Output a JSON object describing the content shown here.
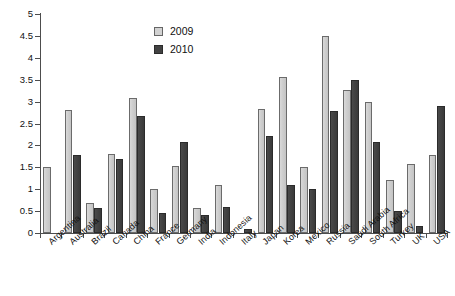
{
  "chart_data": {
    "type": "bar",
    "title": "",
    "subtitle": "",
    "xlabel": "",
    "ylabel": "",
    "ylim": [
      0,
      5
    ],
    "ytick_labels": [
      "0",
      "0.5",
      "1",
      "1.5",
      "2",
      "2.5",
      "3",
      "3.5",
      "4",
      "4.5",
      "5"
    ],
    "ytick_values": [
      0,
      0.5,
      1,
      1.5,
      2,
      2.5,
      3,
      3.5,
      4,
      4.5,
      5
    ],
    "grid": false,
    "legend_position": "top-center",
    "categories": [
      "Argentina",
      "Australia",
      "Brazil",
      "Canada",
      "China",
      "France",
      "Germany",
      "India",
      "Indonesia",
      "Italy",
      "Japan",
      "Korea",
      "Mexico",
      "Russia",
      "Saudi Arabia",
      "South Africa",
      "Turkey",
      "UK",
      "USA"
    ],
    "series": [
      {
        "name": "2009",
        "color": "#d2d2d2",
        "values": [
          1.5,
          2.8,
          0.68,
          1.8,
          3.09,
          1.0,
          1.52,
          0.58,
          1.09,
          0.0,
          2.83,
          3.57,
          1.51,
          4.49,
          3.27,
          2.98,
          1.2,
          1.58,
          1.78
        ]
      },
      {
        "name": "2010",
        "color": "#424242",
        "values": [
          0.0,
          1.77,
          0.56,
          1.69,
          2.66,
          0.46,
          2.08,
          0.42,
          0.6,
          0.1,
          2.21,
          1.1,
          1.0,
          2.79,
          3.5,
          2.08,
          0.5,
          0.17,
          2.9
        ]
      }
    ]
  },
  "legend": {
    "items": [
      {
        "label": "2009",
        "swatch": "light-gray-swatch"
      },
      {
        "label": "2010",
        "swatch": "dark-gray-swatch"
      }
    ]
  },
  "colors": {
    "series_2009": "#d2d2d2",
    "series_2010": "#424242",
    "axis": "#4d4d4d",
    "text": "#111111",
    "background": "#ffffff"
  }
}
